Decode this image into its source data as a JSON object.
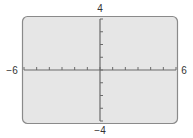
{
  "chart_data": {
    "type": "line",
    "title": "",
    "xlabel": "",
    "ylabel": "",
    "xlim": [
      -6,
      6
    ],
    "ylim": [
      -4,
      4
    ],
    "xscale": 1,
    "yscale": 1,
    "grid": false,
    "series": [],
    "tick_labels": {
      "xmin": "−6",
      "xmax": "6",
      "ymax": "4",
      "ymin": "−4"
    }
  },
  "colors": {
    "screen_fill": "#e6e6e6",
    "screen_border": "#8a8a8a",
    "axis": "#6a6a6a",
    "label": "#333333"
  }
}
